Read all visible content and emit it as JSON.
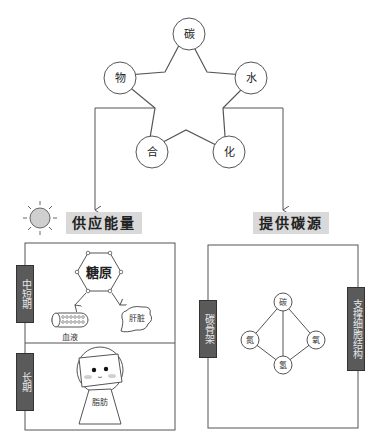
{
  "star": {
    "nodes": [
      "碳",
      "水",
      "化",
      "合",
      "物"
    ],
    "note": "carbohydrate star: 碳水化合物"
  },
  "branches": {
    "left": {
      "caption": "供应能量",
      "icon": "sun-icon"
    },
    "right": {
      "caption": "提供碳源"
    }
  },
  "left_panel": {
    "sections": [
      {
        "side_label": "中短期",
        "center": "糖原",
        "items": [
          "血液",
          "肝脏"
        ]
      },
      {
        "side_label": "长期",
        "figure_label": "脂肪"
      }
    ]
  },
  "right_panel": {
    "left_label": "碳骨架",
    "right_label": "支撑细胞结构",
    "atoms": {
      "top": "碳",
      "left": "氮",
      "right": "氧",
      "bottom": "氢"
    }
  },
  "colors": {
    "caption_bg": "#d9d9d9",
    "label_bg": "#5a5a5a",
    "line": "#555555",
    "sun_fill": "#cfcfcf"
  }
}
